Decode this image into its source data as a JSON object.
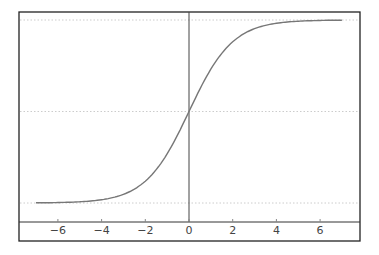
{
  "chart_data": {
    "type": "line",
    "title": "",
    "xlabel": "",
    "ylabel": "",
    "xlim": [
      -7.0,
      7.0
    ],
    "ylim": [
      -0.1,
      1.0
    ],
    "x_ticks": [
      -6,
      -4,
      -2,
      0,
      2,
      4,
      6
    ],
    "x_tick_labels": [
      "−6",
      "−4",
      "−2",
      "0",
      "2",
      "4",
      "6"
    ],
    "y_gridlines": [
      0.0,
      0.5,
      1.0
    ],
    "grid": "horizontal dotted",
    "legend": null,
    "series": [
      {
        "name": "sigmoid",
        "function": "1/(1+exp(-x))",
        "x": [
          -7,
          -6,
          -5,
          -4,
          -3,
          -2,
          -1,
          0,
          1,
          2,
          3,
          4,
          5,
          6,
          7
        ],
        "y": [
          0.001,
          0.002,
          0.007,
          0.018,
          0.047,
          0.119,
          0.269,
          0.5,
          0.731,
          0.881,
          0.953,
          0.982,
          0.993,
          0.998,
          0.999
        ],
        "color": "#777777"
      }
    ]
  },
  "colors": {
    "frame": "#222222",
    "curve": "#777777",
    "grid": "#cccccc",
    "vaxis": "#555555"
  }
}
